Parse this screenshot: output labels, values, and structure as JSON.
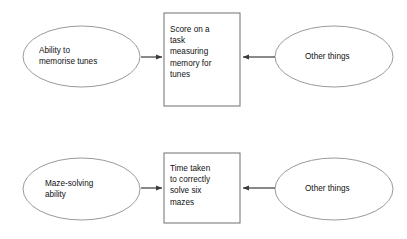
{
  "diagram": {
    "type": "flow-diagram",
    "background_color": "#ffffff",
    "ellipse_stroke_color": "#9a9a9a",
    "box_stroke_color": "#7d7d7d",
    "arrow_color": "#3a3a3a",
    "text_color": "#111111",
    "rows": [
      {
        "id": "memory-for-tunes-row",
        "source_ellipse": {
          "label": "Ability to\nmemorise tunes",
          "cx": 81.5,
          "cy": 56.5,
          "rx": 58.5,
          "ry": 30.5
        },
        "outcome_box": {
          "label": "Score on a\ntask\nmeasuring\nmemory for\ntunes",
          "x": 164,
          "y": 13,
          "width": 76,
          "height": 93
        },
        "other_ellipse": {
          "label": "Other things",
          "cx": 334,
          "cy": 56.5,
          "rx": 59,
          "ry": 30.5
        },
        "left_arrow": {
          "from_x": 141,
          "to_x": 163,
          "y": 57,
          "direction": "right"
        },
        "right_arrow": {
          "from_x": 275,
          "to_x": 242,
          "y": 57,
          "direction": "left"
        }
      },
      {
        "id": "maze-solving-row",
        "source_ellipse": {
          "label": "Maze-solving\nability",
          "cx": 81.5,
          "cy": 189,
          "rx": 58.5,
          "ry": 31
        },
        "outcome_box": {
          "label": "Time taken\nto correctly\nsolve six\nmazes",
          "x": 164,
          "y": 153,
          "width": 76,
          "height": 70
        },
        "other_ellipse": {
          "label": "Other things",
          "cx": 334,
          "cy": 189,
          "rx": 59,
          "ry": 31
        },
        "left_arrow": {
          "from_x": 141,
          "to_x": 163,
          "y": 188,
          "direction": "right"
        },
        "right_arrow": {
          "from_x": 275,
          "to_x": 242,
          "y": 188,
          "direction": "left"
        }
      }
    ]
  }
}
